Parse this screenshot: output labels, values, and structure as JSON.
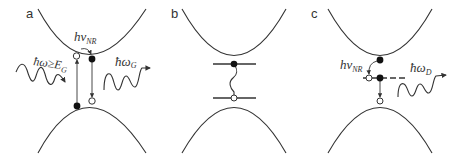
{
  "figure": {
    "panels": [
      {
        "id": "a",
        "label": "a",
        "annotations": {
          "excitation": "ħω≥E",
          "excitation_sub": "G",
          "nonradiative": "hν",
          "nonradiative_sub": "NR",
          "emission": "ħω",
          "emission_sub": "G"
        }
      },
      {
        "id": "b",
        "label": "b"
      },
      {
        "id": "c",
        "label": "c",
        "annotations": {
          "nonradiative": "hν",
          "nonradiative_sub": "NR",
          "emission": "ħω",
          "emission_sub": "D"
        }
      }
    ],
    "colors": {
      "stroke": "#333333",
      "background": "#ffffff"
    }
  }
}
